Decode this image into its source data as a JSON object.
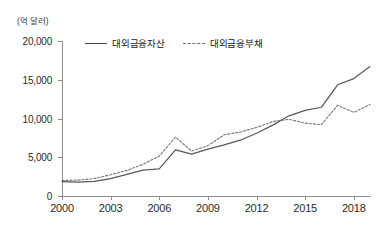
{
  "chart_data": {
    "type": "line",
    "title": "",
    "unit_label": "(억 달러)",
    "xlabel": "",
    "ylabel": "",
    "grid": false,
    "legend_position": "top-left-inside",
    "xlim": [
      2000,
      2019
    ],
    "ylim": [
      0,
      20000
    ],
    "yticks": [
      0,
      5000,
      10000,
      15000,
      20000
    ],
    "ytick_labels": [
      "0",
      "5,000",
      "10,000",
      "15,000",
      "20,000"
    ],
    "xticks": [
      2000,
      2003,
      2006,
      2009,
      2012,
      2015,
      2018
    ],
    "xtick_labels": [
      "2000",
      "2003",
      "2006",
      "2009",
      "2012",
      "2015",
      "2018"
    ],
    "x": [
      2000,
      2001,
      2002,
      2003,
      2004,
      2005,
      2006,
      2007,
      2008,
      2009,
      2010,
      2011,
      2012,
      2013,
      2014,
      2015,
      2016,
      2017,
      2018,
      2019
    ],
    "series": [
      {
        "name": "대외금융자산",
        "style": "solid",
        "color": "#595959",
        "values": [
          1870,
          1800,
          1900,
          2250,
          2800,
          3350,
          3500,
          5950,
          5400,
          6050,
          6600,
          7200,
          8100,
          9150,
          10350,
          11050,
          11450,
          14350,
          15150,
          16700
        ]
      },
      {
        "name": "대외금융부채",
        "style": "dashed",
        "color": "#7a7a7a",
        "values": [
          2000,
          2050,
          2250,
          2750,
          3300,
          4100,
          5150,
          7600,
          5800,
          6500,
          7900,
          8250,
          8850,
          9600,
          9900,
          9400,
          9200,
          11700,
          10800,
          11800
        ]
      }
    ]
  },
  "legend": {
    "items": [
      {
        "label": "대외금융자산",
        "style": "solid"
      },
      {
        "label": "대외금융부채",
        "style": "dashed"
      }
    ]
  }
}
